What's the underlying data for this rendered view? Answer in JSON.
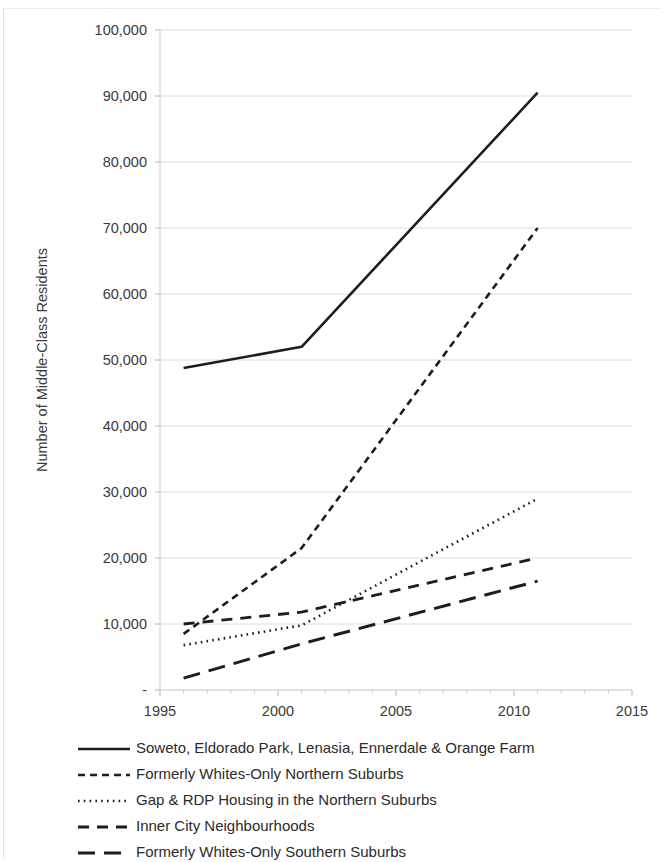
{
  "chart_data": {
    "type": "line",
    "title": "",
    "xlabel": "",
    "ylabel": "Number of Middle-Class Residents",
    "xlim": [
      1995,
      2015
    ],
    "ylim": [
      0,
      100000
    ],
    "grid": true,
    "legend_position": "bottom-left",
    "x_ticks": [
      "1995",
      "2000",
      "2005",
      "2010",
      "2015"
    ],
    "x_tick_values": [
      1995,
      2000,
      2005,
      2010,
      2015
    ],
    "x_minor_tick_interval": 1,
    "y_ticks": [
      "-",
      "10,000",
      "20,000",
      "30,000",
      "40,000",
      "50,000",
      "60,000",
      "70,000",
      "80,000",
      "90,000",
      "100,000"
    ],
    "y_tick_values": [
      0,
      10000,
      20000,
      30000,
      40000,
      50000,
      60000,
      70000,
      80000,
      90000,
      100000
    ],
    "x": [
      1996,
      2001,
      2011
    ],
    "series": [
      {
        "name": "Soweto, Eldorado Park, Lenasia, Ennerdale & Orange Farm",
        "style": "solid",
        "color": "#1d1d1d",
        "values": [
          48800,
          52000,
          90500
        ]
      },
      {
        "name": "Formerly Whites-Only Northern Suburbs",
        "style": "short-dash",
        "color": "#1d1d1d",
        "values": [
          8500,
          21500,
          70000
        ]
      },
      {
        "name": "Gap & RDP Housing in the Northern Suburbs",
        "style": "dotted",
        "color": "#1d1d1d",
        "values": [
          6800,
          9800,
          29000
        ]
      },
      {
        "name": "Inner City Neighbourhoods",
        "style": "medium-dash",
        "color": "#1d1d1d",
        "values": [
          10000,
          11800,
          20000
        ]
      },
      {
        "name": "Formerly Whites-Only Southern Suburbs",
        "style": "long-dash",
        "color": "#1d1d1d",
        "values": [
          1800,
          7000,
          16500
        ]
      }
    ]
  },
  "legend": {
    "items": [
      {
        "label": "Soweto, Eldorado Park, Lenasia, Ennerdale & Orange Farm",
        "style": "solid"
      },
      {
        "label": "Formerly Whites-Only Northern Suburbs",
        "style": "short-dash"
      },
      {
        "label": "Gap & RDP Housing in the Northern Suburbs",
        "style": "dotted"
      },
      {
        "label": "Inner City Neighbourhoods",
        "style": "medium-dash"
      },
      {
        "label": "Formerly Whites-Only Southern Suburbs",
        "style": "long-dash"
      }
    ]
  }
}
